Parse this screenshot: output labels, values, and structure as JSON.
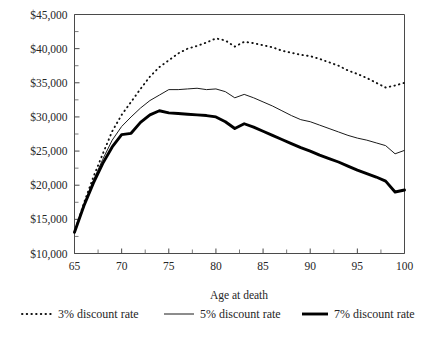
{
  "chart_data": {
    "type": "line",
    "title": "",
    "xlabel": "Age at death",
    "ylabel": "",
    "xlim": [
      65,
      100
    ],
    "ylim": [
      10000,
      45000
    ],
    "grid": false,
    "legend_position": "bottom",
    "x_ticks": [
      65,
      70,
      75,
      80,
      85,
      90,
      95,
      100
    ],
    "x_tick_labels": [
      "65",
      "70",
      "75",
      "80",
      "85",
      "90",
      "95",
      "100"
    ],
    "y_ticks": [
      10000,
      15000,
      20000,
      25000,
      30000,
      35000,
      40000,
      45000
    ],
    "y_tick_labels": [
      "$10,000",
      "$15,000",
      "$20,000",
      "$25,000",
      "$30,000",
      "$35,000",
      "$40,000",
      "$45,000"
    ],
    "y_minor_tick_step": 2500,
    "x": [
      65,
      66,
      67,
      68,
      69,
      70,
      71,
      72,
      73,
      74,
      75,
      76,
      77,
      78,
      79,
      80,
      81,
      82,
      83,
      84,
      85,
      86,
      87,
      88,
      89,
      90,
      91,
      92,
      93,
      94,
      95,
      96,
      97,
      98,
      99,
      100
    ],
    "series": [
      {
        "name": "3% discount rate",
        "style": "dotted",
        "values": [
          13100,
          17400,
          21200,
          24600,
          27900,
          30300,
          32200,
          34100,
          35900,
          37300,
          38300,
          39300,
          40000,
          40400,
          40900,
          41500,
          41200,
          40300,
          41000,
          40800,
          40500,
          40200,
          39700,
          39400,
          39100,
          38900,
          38500,
          38000,
          37500,
          36800,
          36300,
          35700,
          35000,
          34300,
          34600,
          35000
        ]
      },
      {
        "name": "5% discount rate",
        "style": "thin-solid",
        "values": [
          13100,
          17200,
          20700,
          23800,
          26600,
          28600,
          30000,
          31300,
          32400,
          33200,
          34000,
          34000,
          34100,
          34200,
          34000,
          34100,
          33700,
          32800,
          33300,
          32800,
          32200,
          31600,
          30900,
          30200,
          29600,
          29300,
          28800,
          28300,
          27800,
          27300,
          26900,
          26600,
          26200,
          25800,
          24600,
          25100
        ]
      },
      {
        "name": "7% discount rate",
        "style": "thick-solid",
        "values": [
          13100,
          17000,
          20300,
          23200,
          25600,
          27400,
          27600,
          29200,
          30300,
          30900,
          30600,
          30500,
          30400,
          30300,
          30200,
          30000,
          29300,
          28300,
          29000,
          28500,
          27900,
          27300,
          26700,
          26100,
          25500,
          25000,
          24400,
          23900,
          23400,
          22800,
          22200,
          21700,
          21200,
          20600,
          19000,
          19300
        ]
      }
    ],
    "legend": [
      {
        "label": "3% discount rate",
        "style": "dotted"
      },
      {
        "label": "5% discount rate",
        "style": "thin-solid"
      },
      {
        "label": "7% discount rate",
        "style": "thick-solid"
      }
    ]
  }
}
